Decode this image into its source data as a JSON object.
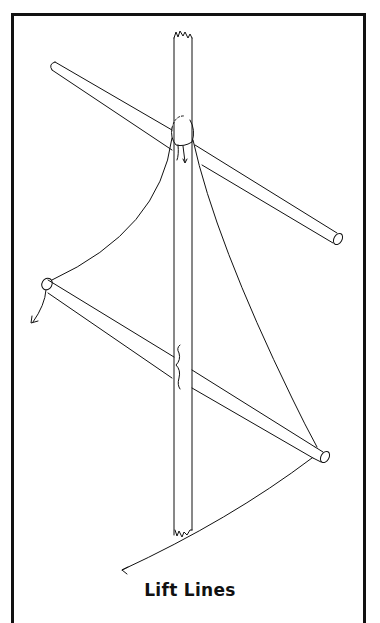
{
  "diagram": {
    "caption": "Lift Lines",
    "elements": [
      "mast (vertical, broken ends top and bottom)",
      "upper yard (diagonal spar crossing mast)",
      "lower yard (diagonal spar crossing mast)",
      "lift line left (from masthead to lower yard left end, arrow)",
      "lift line right (from masthead to lower yard right end, arrow)",
      "knot at masthead"
    ],
    "colors": {
      "line": "#111111",
      "background": "#ffffff"
    }
  }
}
